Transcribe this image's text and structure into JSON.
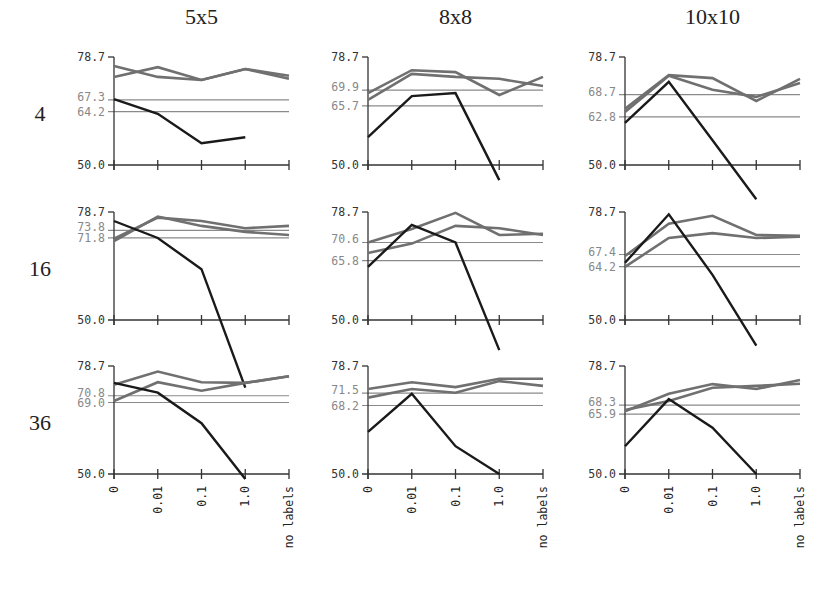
{
  "chart_data": {
    "type": "line",
    "layout": "grid 3x3 small multiples",
    "column_titles": [
      "5x5",
      "8x8",
      "10x10"
    ],
    "row_titles": [
      "4",
      "16",
      "36"
    ],
    "categories": [
      "0",
      "0.01",
      "0.1",
      "1.0",
      "no labels"
    ],
    "ylim": [
      50.0,
      78.7
    ],
    "ytick_main": [
      "78.7",
      "50.0"
    ],
    "grid": false,
    "legend": null,
    "colors": {
      "gray_series": "#707070",
      "black_series": "#1a1a1a",
      "ref_line": "#8a8a8a",
      "axis": "#333333"
    },
    "panels": [
      {
        "row": "4",
        "col": "5x5",
        "ref_lines": [
          67.3,
          64.2
        ],
        "series": [
          {
            "name": "gray-a",
            "values": [
              76.3,
              73.4,
              72.6,
              75.5,
              72.9
            ]
          },
          {
            "name": "gray-b",
            "values": [
              73.4,
              76.0,
              72.6,
              75.5,
              73.7
            ]
          },
          {
            "name": "black",
            "values": [
              67.5,
              63.6,
              55.8,
              57.4,
              null
            ]
          }
        ]
      },
      {
        "row": "4",
        "col": "8x8",
        "ref_lines": [
          69.9,
          65.7
        ],
        "series": [
          {
            "name": "gray-a",
            "values": [
              69.1,
              75.2,
              74.7,
              68.6,
              73.4
            ]
          },
          {
            "name": "gray-b",
            "values": [
              67.3,
              74.2,
              73.4,
              72.9,
              71.0
            ]
          },
          {
            "name": "black",
            "values": [
              57.4,
              68.3,
              69.1,
              46.0,
              null
            ]
          }
        ]
      },
      {
        "row": "4",
        "col": "10x10",
        "ref_lines": [
          68.7,
          62.8
        ],
        "series": [
          {
            "name": "gray-a",
            "values": [
              64.9,
              73.9,
              73.1,
              67.0,
              72.9
            ]
          },
          {
            "name": "gray-b",
            "values": [
              64.1,
              73.7,
              70.0,
              68.1,
              71.8
            ]
          },
          {
            "name": "black",
            "values": [
              61.2,
              72.1,
              56.6,
              40.9,
              null
            ]
          }
        ]
      },
      {
        "row": "16",
        "col": "5x5",
        "ref_lines": [
          73.8,
          71.8
        ],
        "series": [
          {
            "name": "gray-a",
            "values": [
              71.6,
              77.2,
              76.3,
              74.4,
              75.0
            ]
          },
          {
            "name": "gray-b",
            "values": [
              71.0,
              77.5,
              75.0,
              73.4,
              72.6
            ]
          },
          {
            "name": "black",
            "values": [
              76.3,
              71.8,
              63.5,
              32.0,
              null
            ]
          }
        ]
      },
      {
        "row": "16",
        "col": "8x8",
        "ref_lines": [
          70.6,
          65.8
        ],
        "series": [
          {
            "name": "gray-a",
            "values": [
              70.6,
              74.2,
              78.5,
              72.6,
              72.9
            ]
          },
          {
            "name": "gray-b",
            "values": [
              67.8,
              70.3,
              75.0,
              74.4,
              72.6
            ]
          },
          {
            "name": "black",
            "values": [
              64.1,
              75.3,
              70.6,
              42.0,
              null
            ]
          }
        ]
      },
      {
        "row": "16",
        "col": "10x10",
        "ref_lines": [
          67.4,
          64.2
        ],
        "series": [
          {
            "name": "gray-a",
            "values": [
              67.0,
              75.6,
              77.7,
              72.6,
              72.4
            ]
          },
          {
            "name": "gray-b",
            "values": [
              64.1,
              71.8,
              73.1,
              71.8,
              72.1
            ]
          },
          {
            "name": "black",
            "values": [
              65.2,
              78.1,
              62.0,
              43.2,
              null
            ]
          }
        ]
      },
      {
        "row": "36",
        "col": "5x5",
        "ref_lines": [
          70.8,
          69.0
        ],
        "series": [
          {
            "name": "gray-a",
            "values": [
              73.7,
              77.2,
              74.4,
              74.2,
              76.0
            ]
          },
          {
            "name": "gray-b",
            "values": [
              69.4,
              74.4,
              72.1,
              74.2,
              76.0
            ]
          },
          {
            "name": "black",
            "values": [
              74.2,
              71.6,
              63.5,
              48.7,
              null
            ]
          }
        ]
      },
      {
        "row": "36",
        "col": "8x8",
        "ref_lines": [
          71.5,
          68.2
        ],
        "series": [
          {
            "name": "gray-a",
            "values": [
              72.6,
              74.4,
              73.1,
              75.3,
              75.3
            ]
          },
          {
            "name": "gray-b",
            "values": [
              70.3,
              72.6,
              71.6,
              74.7,
              73.4
            ]
          },
          {
            "name": "black",
            "values": [
              61.2,
              71.3,
              57.4,
              50.0,
              null
            ]
          }
        ]
      },
      {
        "row": "36",
        "col": "10x10",
        "ref_lines": [
          68.3,
          65.9
        ],
        "series": [
          {
            "name": "gray-a",
            "values": [
              66.7,
              71.3,
              73.9,
              72.6,
              75.0
            ]
          },
          {
            "name": "gray-b",
            "values": [
              67.0,
              69.4,
              72.9,
              73.4,
              74.0
            ]
          },
          {
            "name": "black",
            "values": [
              57.4,
              69.9,
              62.3,
              50.0,
              null
            ]
          }
        ]
      }
    ]
  }
}
